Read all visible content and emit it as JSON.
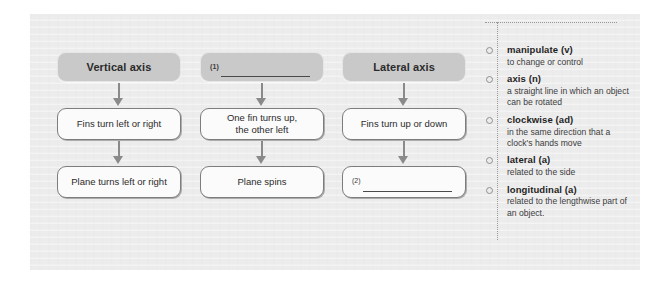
{
  "page": {
    "background_color": "#ececec"
  },
  "flowchart": {
    "columns": [
      {
        "id": "vertical-axis",
        "header": {
          "label": "Vertical axis",
          "is_blank": false,
          "question_number": ""
        },
        "steps": [
          {
            "label": "Fins turn left or right",
            "is_blank": false,
            "question_number": ""
          },
          {
            "label": "Plane turns left or right",
            "is_blank": false,
            "question_number": ""
          }
        ]
      },
      {
        "id": "blank-axis",
        "header": {
          "label": "",
          "is_blank": true,
          "question_number": "(1)"
        },
        "steps": [
          {
            "label": "One fin turns up,\nthe other left",
            "is_blank": false,
            "question_number": ""
          },
          {
            "label": "Plane spins",
            "is_blank": false,
            "question_number": ""
          }
        ]
      },
      {
        "id": "lateral-axis",
        "header": {
          "label": "Lateral axis",
          "is_blank": false,
          "question_number": ""
        },
        "steps": [
          {
            "label": "Fins turn up or down",
            "is_blank": false,
            "question_number": ""
          },
          {
            "label": "",
            "is_blank": true,
            "question_number": "(2)"
          }
        ]
      }
    ]
  },
  "glossary": {
    "items": [
      {
        "term": "manipulate (v)",
        "definition": "to change or control"
      },
      {
        "term": "axis (n)",
        "definition": "a straight line in which an object can be rotated"
      },
      {
        "term": "clockwise (ad)",
        "definition": "in the same direction that a clock's hands move"
      },
      {
        "term": "lateral (a)",
        "definition": "related to the side"
      },
      {
        "term": "longitudinal (a)",
        "definition": "related to the lengthwise part of an object."
      }
    ]
  }
}
